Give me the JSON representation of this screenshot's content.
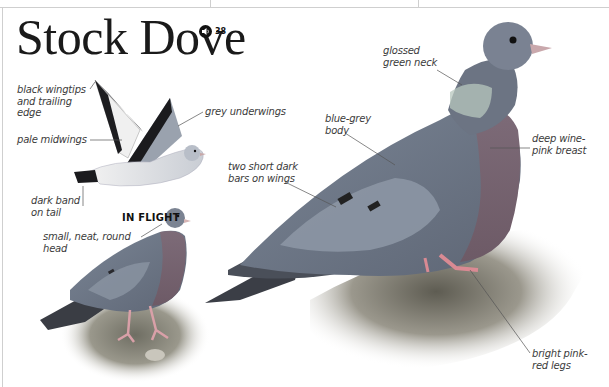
{
  "page": {
    "species_title": "Stock Dove",
    "audio": {
      "icon": "speaker-icon",
      "track_number": "38"
    }
  },
  "illustrations": {
    "flight": {
      "heading": "IN FLIGHT"
    },
    "perched_small": {},
    "perched_large": {}
  },
  "labels": {
    "black_wingtips": [
      "black wingtips",
      "and trailing",
      "edge"
    ],
    "pale_midwings": [
      "pale midwings"
    ],
    "grey_underwings": [
      "grey underwings"
    ],
    "dark_band": [
      "dark band",
      "on tail"
    ],
    "small_head": [
      "small, neat, round",
      "head"
    ],
    "blue_grey_body": [
      "blue-grey",
      "body"
    ],
    "two_bars": [
      "two short dark",
      "bars on wings"
    ],
    "glossed_neck": [
      "glossed",
      "green neck"
    ],
    "wine_breast": [
      "deep wine-",
      "pink breast"
    ],
    "pink_legs": [
      "bright pink-",
      "red legs"
    ]
  },
  "colors": {
    "body_blue_grey": "#7d8796",
    "wing_grey": "#8e97a5",
    "breast_wine": "#8a6a78",
    "neck_green": "#7fa08a",
    "leg_pink": "#d98a93",
    "wingtip_black": "#1b1b1e",
    "ground": "#8c8a7e"
  }
}
